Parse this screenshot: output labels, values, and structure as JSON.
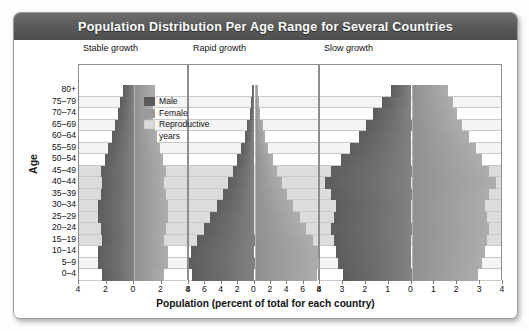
{
  "title": "Population Distribution Per Age Range for Several Countries",
  "axes": {
    "ylabel": "Age",
    "xlabel": "Population (percent of total for each country)"
  },
  "legend": {
    "items": [
      {
        "key": "male",
        "label": "Male",
        "color": "#5a5a5a"
      },
      {
        "key": "female",
        "label": "Female",
        "color": "#9a9a9a"
      },
      {
        "key": "repro",
        "label": "Reproductive",
        "label2": "years",
        "color": "#d9d9d9"
      }
    ]
  },
  "age_groups": [
    "80+",
    "75–79",
    "70–74",
    "65–69",
    "60–64",
    "55–59",
    "50–54",
    "45–49",
    "40–44",
    "35–39",
    "30–34",
    "25–29",
    "20–24",
    "15–19",
    "10–14",
    "5–9",
    "0–4"
  ],
  "reproductive_range": [
    "45–49",
    "40–44",
    "35–39",
    "30–34",
    "25–29",
    "20–24",
    "15–19"
  ],
  "chart_data": {
    "type": "bar",
    "title": "Population Distribution Per Age Range for Several Countries",
    "xlabel": "Population (percent of total for each country)",
    "ylabel": "Age",
    "grid": true,
    "legend_position": "inside-upper-left",
    "categories": [
      "80+",
      "75–79",
      "70–74",
      "65–69",
      "60–64",
      "55–59",
      "50–54",
      "45–49",
      "40–44",
      "35–39",
      "30–34",
      "25–29",
      "20–24",
      "15–19",
      "10–14",
      "5–9",
      "0–4"
    ],
    "panels": [
      {
        "name": "Stable growth",
        "xlim": [
          4,
          4
        ],
        "xticks": [
          4,
          2,
          0,
          2,
          4
        ],
        "series": [
          {
            "name": "Male",
            "values": [
              0.8,
              1.0,
              1.2,
              1.4,
              1.6,
              1.9,
              2.1,
              2.4,
              2.3,
              2.4,
              2.6,
              2.6,
              2.4,
              2.3,
              2.6,
              2.6,
              2.3
            ]
          },
          {
            "name": "Female",
            "values": [
              1.5,
              1.4,
              1.4,
              1.5,
              1.7,
              1.9,
              2.1,
              2.3,
              2.2,
              2.3,
              2.5,
              2.5,
              2.3,
              2.2,
              2.5,
              2.5,
              2.2
            ]
          }
        ]
      },
      {
        "name": "Rapid growth",
        "xlim": [
          8,
          8
        ],
        "xticks": [
          8,
          6,
          4,
          2,
          0,
          2,
          4,
          6,
          8
        ],
        "series": [
          {
            "name": "Male",
            "values": [
              0.3,
              0.4,
              0.6,
              0.9,
              1.2,
              1.6,
              2.1,
              2.6,
              3.2,
              3.9,
              4.6,
              5.4,
              6.2,
              7.0,
              7.8,
              8.0,
              7.6
            ]
          },
          {
            "name": "Female",
            "values": [
              0.4,
              0.5,
              0.7,
              1.0,
              1.3,
              1.7,
              2.2,
              2.7,
              3.3,
              4.0,
              4.7,
              5.5,
              6.3,
              7.1,
              7.8,
              8.0,
              7.6
            ]
          }
        ]
      },
      {
        "name": "Slow growth",
        "xlim": [
          4,
          4
        ],
        "xticks": [
          4,
          3,
          2,
          1,
          0,
          1,
          2,
          3,
          4
        ],
        "series": [
          {
            "name": "Male",
            "values": [
              0.9,
              1.3,
              1.7,
              2.0,
              2.3,
              2.7,
              3.1,
              3.5,
              3.8,
              3.5,
              3.3,
              3.4,
              3.5,
              3.4,
              3.3,
              3.2,
              3.0
            ]
          },
          {
            "name": "Female",
            "values": [
              1.6,
              1.8,
              2.0,
              2.2,
              2.5,
              2.8,
              3.1,
              3.4,
              3.7,
              3.4,
              3.2,
              3.3,
              3.4,
              3.3,
              3.2,
              3.1,
              2.9
            ]
          }
        ]
      }
    ]
  }
}
